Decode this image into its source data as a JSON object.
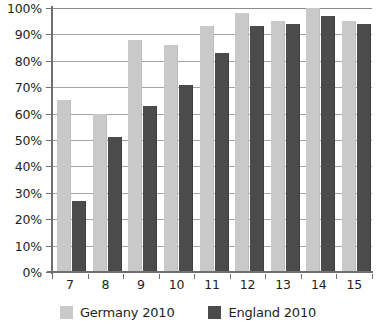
{
  "chart_data": {
    "type": "bar",
    "title": "",
    "subtitle": "",
    "xlabel": "",
    "ylabel": "",
    "categories": [
      "7",
      "8",
      "9",
      "10",
      "11",
      "12",
      "13",
      "14",
      "15"
    ],
    "series": [
      {
        "name": "Germany 2010",
        "color": "#c9c9c9",
        "values": [
          65,
          60,
          88,
          86,
          93,
          98,
          95,
          100,
          95
        ]
      },
      {
        "name": "England 2010",
        "color": "#4b4b4b",
        "values": [
          27,
          51,
          63,
          71,
          83,
          93,
          94,
          97,
          94
        ]
      }
    ],
    "ylim": [
      0,
      100
    ],
    "ytick_values": [
      0,
      10,
      20,
      30,
      40,
      50,
      60,
      70,
      80,
      90,
      100
    ],
    "ytick_labels": [
      "0%",
      "10%",
      "20%",
      "30%",
      "40%",
      "50%",
      "60%",
      "70%",
      "80%",
      "90%",
      "100%"
    ],
    "grid": true,
    "grid_axis": "y",
    "legend_position": "bottom",
    "legend_entries": [
      "Germany 2010",
      "England 2010"
    ],
    "background_color": "#ffffff",
    "axis_color": "#6f6f6f",
    "gridline_color": "#a6a6a6"
  }
}
